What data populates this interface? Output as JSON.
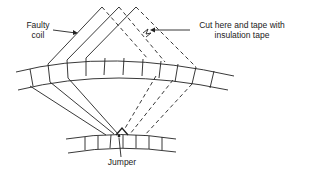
{
  "diagram": {
    "labels": {
      "faulty_coil": [
        "Faulty",
        "coil"
      ],
      "cut_note": [
        "Cut here and tape with",
        "insulation tape"
      ],
      "jumper": "Jumper"
    },
    "colors": {
      "line": "#222222",
      "background": "#ffffff"
    }
  }
}
